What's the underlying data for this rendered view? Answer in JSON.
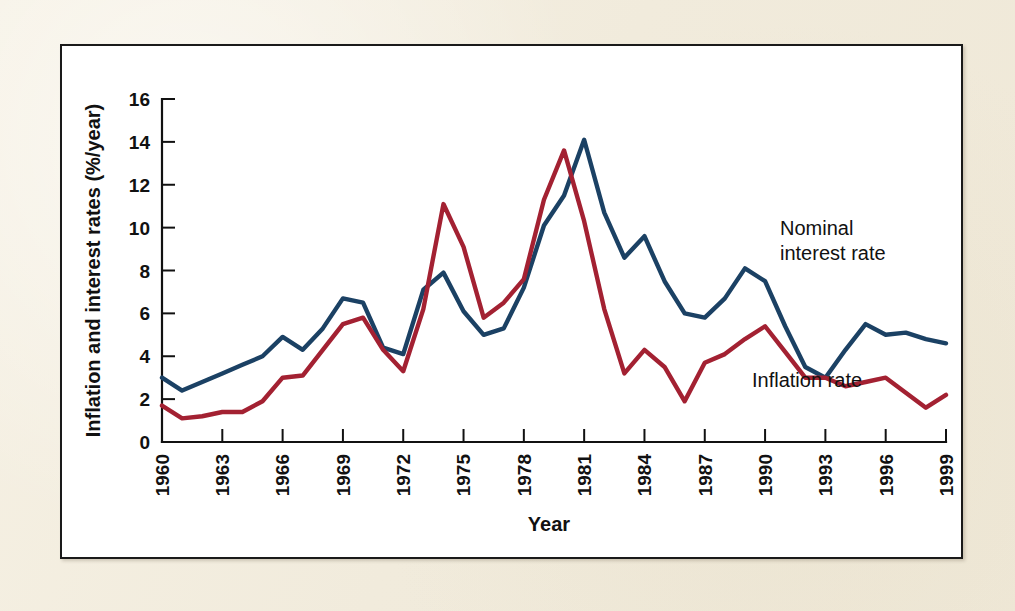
{
  "figure": {
    "background_color": "#f4efe1",
    "panel_color": "#ffffff",
    "panel_border_color": "#1a1a1a"
  },
  "annotations": {
    "nominal_line1": "Nominal",
    "nominal_line2": "interest rate",
    "inflation": "Inflation rate"
  },
  "chart_data": {
    "type": "line",
    "title": "",
    "xlabel": "Year",
    "ylabel": "Inflation and interest rates (%/year)",
    "xlim": [
      1960,
      1999
    ],
    "ylim": [
      0,
      16
    ],
    "ytick_values": [
      0,
      2,
      4,
      6,
      8,
      10,
      12,
      14,
      16
    ],
    "ytick_labels": [
      "0",
      "2",
      "4",
      "6",
      "8",
      "10",
      "12",
      "14",
      "16"
    ],
    "xtick_values": [
      1960,
      1963,
      1966,
      1969,
      1972,
      1975,
      1978,
      1981,
      1984,
      1987,
      1990,
      1993,
      1996,
      1999
    ],
    "xtick_labels": [
      "1960",
      "1963",
      "1966",
      "1969",
      "1972",
      "1975",
      "1978",
      "1981",
      "1984",
      "1987",
      "1990",
      "1993",
      "1996",
      "1999"
    ],
    "xtick_rotation": 90,
    "grid": false,
    "legend_position": "inline-annotation",
    "x": [
      1960,
      1961,
      1962,
      1963,
      1964,
      1965,
      1966,
      1967,
      1968,
      1969,
      1970,
      1971,
      1972,
      1973,
      1974,
      1975,
      1976,
      1977,
      1978,
      1979,
      1980,
      1981,
      1982,
      1983,
      1984,
      1985,
      1986,
      1987,
      1988,
      1989,
      1990,
      1991,
      1992,
      1993,
      1994,
      1995,
      1996,
      1997,
      1998,
      1999
    ],
    "series": [
      {
        "name": "Nominal interest rate",
        "color": "#1b4164",
        "values": [
          3.0,
          2.4,
          2.8,
          3.2,
          3.6,
          4.0,
          4.9,
          4.3,
          5.3,
          6.7,
          6.5,
          4.4,
          4.1,
          7.1,
          7.9,
          6.1,
          5.0,
          5.3,
          7.2,
          10.1,
          11.5,
          14.1,
          10.7,
          8.6,
          9.6,
          7.5,
          6.0,
          5.8,
          6.7,
          8.1,
          7.5,
          5.4,
          3.5,
          3.0,
          4.3,
          5.5,
          5.0,
          5.1,
          4.8,
          4.6
        ]
      },
      {
        "name": "Inflation rate",
        "color": "#a32132",
        "values": [
          1.7,
          1.1,
          1.2,
          1.4,
          1.4,
          1.9,
          3.0,
          3.1,
          4.3,
          5.5,
          5.8,
          4.3,
          3.3,
          6.2,
          11.1,
          9.1,
          5.8,
          6.5,
          7.6,
          11.3,
          13.6,
          10.3,
          6.2,
          3.2,
          4.3,
          3.5,
          1.9,
          3.7,
          4.1,
          4.8,
          5.4,
          4.2,
          3.0,
          3.0,
          2.6,
          2.8,
          3.0,
          2.3,
          1.6,
          2.2
        ]
      }
    ]
  }
}
